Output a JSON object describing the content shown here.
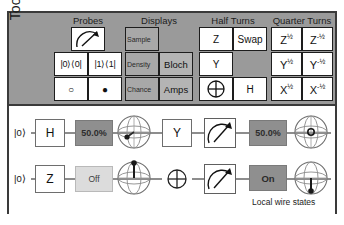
{
  "app": {
    "title": "Quirk quantum circuit simulator"
  },
  "toolbox": {
    "label": "Toolbox",
    "groups": [
      {
        "name": "probes",
        "title": "Probes",
        "cells": [
          {
            "label": "",
            "icon": "measure-probe-icon",
            "kind": "icon"
          },
          {
            "label": "",
            "icon": "",
            "kind": "blank"
          },
          {
            "label": "|0⟩⟨0|",
            "icon": "",
            "kind": "ket"
          },
          {
            "label": "|1⟩⟨1|",
            "icon": "",
            "kind": "ket"
          },
          {
            "label": "○",
            "icon": "anti-control-icon",
            "kind": "glyph"
          },
          {
            "label": "●",
            "icon": "control-icon",
            "kind": "glyph"
          }
        ]
      },
      {
        "name": "displays",
        "title": "Displays",
        "cells": [
          {
            "label": "Sample",
            "icon": "",
            "kind": "display"
          },
          {
            "label": "",
            "icon": "",
            "kind": "blank"
          },
          {
            "label": "Density",
            "icon": "",
            "kind": "display"
          },
          {
            "label": "Bloch",
            "icon": "",
            "kind": "display-big"
          },
          {
            "label": "Chance",
            "icon": "",
            "kind": "display"
          },
          {
            "label": "Amps",
            "icon": "",
            "kind": "display-big"
          }
        ]
      },
      {
        "name": "half-turns",
        "title": "Half Turns",
        "cells": [
          {
            "label": "Z",
            "icon": "",
            "kind": "text"
          },
          {
            "label": "Swap",
            "icon": "",
            "kind": "text-small"
          },
          {
            "label": "Y",
            "icon": "",
            "kind": "text"
          },
          {
            "label": "",
            "icon": "",
            "kind": "blank"
          },
          {
            "label": "",
            "icon": "x-gate-icon",
            "kind": "icon"
          },
          {
            "label": "H",
            "icon": "",
            "kind": "text"
          }
        ]
      },
      {
        "name": "quarter-turns",
        "title": "Quarter Turns",
        "cells": [
          {
            "label": "Z",
            "exp": "½",
            "icon": "",
            "kind": "pow"
          },
          {
            "label": "Z",
            "exp": "-½",
            "icon": "",
            "kind": "pow"
          },
          {
            "label": "Y",
            "exp": "½",
            "icon": "",
            "kind": "pow"
          },
          {
            "label": "Y",
            "exp": "-½",
            "icon": "",
            "kind": "pow"
          },
          {
            "label": "X",
            "exp": "½",
            "icon": "",
            "kind": "pow"
          },
          {
            "label": "X",
            "exp": "-½",
            "icon": "",
            "kind": "pow"
          }
        ]
      }
    ]
  },
  "circuit": {
    "caption": "Local wire states",
    "wires": [
      {
        "name": "wire-0",
        "ket": "|0⟩",
        "gate_1": "H",
        "display_1": "50.0%",
        "gate_2": "Y",
        "display_2": "50.0%"
      },
      {
        "name": "wire-1",
        "ket": "|0⟩",
        "gate_1": "Z",
        "display_1": "Off",
        "gate_2": "",
        "display_2": "On"
      }
    ]
  },
  "colors": {
    "toolbox_bg": "#9a9a9a",
    "frame_border": "#3a3a3a",
    "wire": "#8d8d8d",
    "display_gray": "#8f8f8f",
    "display_light": "#dcdcdc"
  }
}
